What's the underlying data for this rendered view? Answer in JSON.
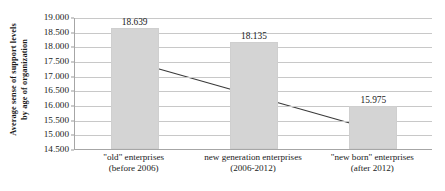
{
  "chart_data": {
    "type": "bar",
    "title": "",
    "subtitle": "",
    "xlabel": "",
    "ylabel": "Average sense of support levels by age of organization",
    "ylabel_lines": [
      "Average sense of support levels",
      "by age of organization"
    ],
    "categories": [
      "\"old\" enterprises (before 2006)",
      "new generation enterprises (2006-2012)",
      "\"new born\" enterprises (after 2012)"
    ],
    "category_lines": [
      [
        "\"old\" enterprises",
        "(before 2006)"
      ],
      [
        "new generation enterprises",
        "(2006-2012)"
      ],
      [
        "\"new born\" enterprises",
        "(after 2012)"
      ]
    ],
    "values": [
      18.639,
      18.135,
      15.975
    ],
    "value_labels": [
      "18.639",
      "18.135",
      "15.975"
    ],
    "ylim": [
      14.5,
      19.0
    ],
    "ytick_step": 0.5,
    "ytick_labels": [
      "19.000",
      "18.500",
      "18.000",
      "17.500",
      "17.000",
      "16.500",
      "16.000",
      "15.500",
      "15.000",
      "14.500"
    ],
    "ytick_values": [
      19.0,
      18.5,
      18.0,
      17.5,
      17.0,
      16.5,
      16.0,
      15.5,
      15.0,
      14.5
    ],
    "grid": true,
    "grid_axis": "y",
    "legend": false,
    "legend_position": "none",
    "bar_color": "#d4d4d4",
    "bar_border_color": "#cfcfcf",
    "gridline_color": "#c8c8c8",
    "axis_color": "#a6a6a6",
    "text_color": "#1a1a1a",
    "annotations": [
      {
        "type": "double-headed-arrow",
        "description": "declining trend arrow from first bar to third bar",
        "from_value": 17.45,
        "to_value": 15.25,
        "color": "#3a3a3a"
      }
    ]
  }
}
